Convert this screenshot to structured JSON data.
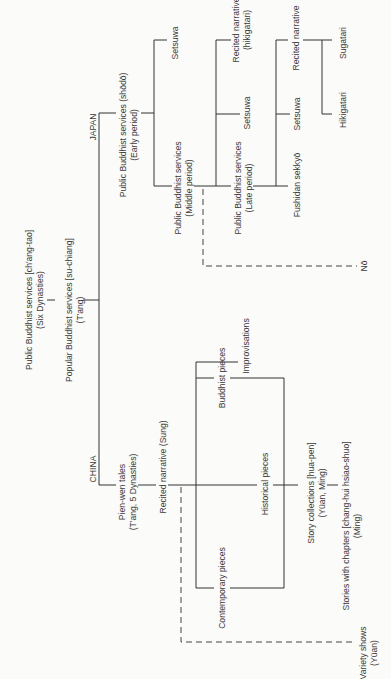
{
  "diagram": {
    "root": {
      "origin": {
        "line1": "Public Buddhist services [ch'ang-tao]",
        "line2": "(Six Dynasties)"
      },
      "popular": {
        "line1": "Popular Buddhist services [su-chiang]",
        "line2": "(T'ang)"
      }
    },
    "japan": {
      "label": "JAPAN",
      "early": {
        "line1": "Public Buddhist services (shōdō)",
        "line2": "(Early period)"
      },
      "early_setsuwa": "Setsuwa",
      "middle": {
        "line1": "Public Buddhist services",
        "line2": "(Middle period)"
      },
      "middle_recited": {
        "line1": "Recited narrative",
        "line2": "(hikigatari)"
      },
      "middle_setsuwa": "Setsuwa",
      "late": {
        "line1": "Public Buddhist services",
        "line2": "(Late period)"
      },
      "late_recited": "Recited narrative",
      "late_setsuwa": "Setsuwa",
      "fushidan": "Fushidan sekkyō",
      "sugatari": "Sugatari",
      "hikigatari": "Hikigatari",
      "no": "Nō"
    },
    "china": {
      "label": "CHINA",
      "pienwen": {
        "line1": "Pien-wen tales",
        "line2": "(T'ang, 5 Dynasties)"
      },
      "recited": "Recited narrative  (Sung)",
      "improvisations": "Improvisations",
      "buddhist": "Buddhist pieces",
      "historical": "Historical pieces",
      "contemporary": "Contemporary pieces",
      "story_collections": {
        "line1": "Story collections  [hua-pen]",
        "line2": "(Yüan, Ming)"
      },
      "stories_chapters": {
        "line1": "Stories with chapters [chang-hui  hsiao-shuo]",
        "line2": "(Ming)"
      },
      "variety": {
        "line1": "Variety shows",
        "line2": "(Yüan)"
      }
    }
  }
}
